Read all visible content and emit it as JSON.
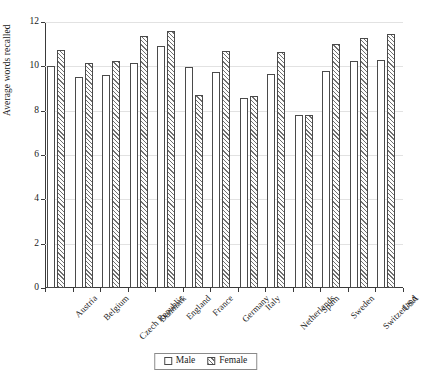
{
  "chart_data": {
    "type": "bar",
    "title": "",
    "xlabel": "",
    "ylabel": "Average words recalled",
    "ylim": [
      0,
      12
    ],
    "yticks": [
      0,
      2,
      4,
      6,
      8,
      10,
      12
    ],
    "grid": true,
    "legend_position": "bottom",
    "categories": [
      "Austria",
      "Belgium",
      "Czech Republic",
      "Denmark",
      "England",
      "France",
      "Germany",
      "Italy",
      "Netherlands",
      "Spain",
      "Sweden",
      "Switzerland",
      "USA"
    ],
    "series": [
      {
        "name": "Male",
        "values": [
          10.0,
          9.5,
          9.6,
          10.15,
          10.9,
          9.95,
          9.75,
          8.55,
          9.65,
          7.8,
          9.8,
          10.25,
          10.3
        ]
      },
      {
        "name": "Female",
        "values": [
          10.75,
          10.15,
          10.25,
          11.35,
          11.6,
          8.7,
          10.7,
          8.65,
          10.65,
          7.8,
          11.0,
          11.3,
          11.45
        ]
      }
    ]
  },
  "legend": {
    "items": [
      {
        "label": "Male",
        "swatch": "open-square-icon"
      },
      {
        "label": "Female",
        "swatch": "hatched-square-icon"
      }
    ]
  }
}
